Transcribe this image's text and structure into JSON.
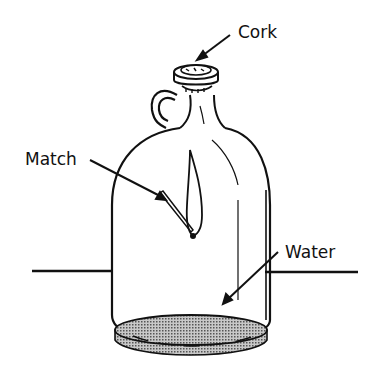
{
  "diagram": {
    "labels": {
      "cork": "Cork",
      "match": "Match",
      "water": "Water"
    },
    "colors": {
      "ink": "#111111",
      "water_fill": "#9a9a9a",
      "background": "#ffffff"
    }
  }
}
